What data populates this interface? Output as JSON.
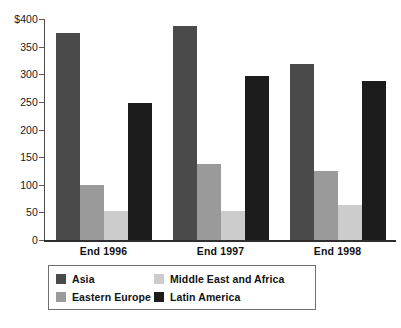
{
  "chart_data": {
    "type": "bar",
    "title": "",
    "subtitle": "",
    "xlabel": "",
    "ylabel": "",
    "categories": [
      "End 1996",
      "End 1997",
      "End 1998"
    ],
    "series": [
      {
        "name": "Asia",
        "color": "#4a4a4a",
        "values": [
          375,
          387,
          318
        ]
      },
      {
        "name": "Eastern Europe",
        "color": "#9a9a9a",
        "values": [
          100,
          138,
          124
        ]
      },
      {
        "name": "Middle East and Africa",
        "color": "#cccccc",
        "values": [
          53,
          53,
          64
        ]
      },
      {
        "name": "Latin America",
        "color": "#1c1c1c",
        "values": [
          248,
          297,
          288
        ]
      }
    ],
    "ylim": [
      0,
      400
    ],
    "y_ticks": [
      0,
      50,
      100,
      150,
      200,
      250,
      300,
      350,
      400
    ],
    "y_tick_labels": [
      "0",
      "50",
      "100",
      "150",
      "200",
      "250",
      "300",
      "350",
      "$400"
    ],
    "grid": false,
    "legend_position": "bottom"
  },
  "axis": {
    "currency_prefix": "$"
  },
  "legend": {
    "entries": [
      {
        "label": "Asia",
        "color": "#4a4a4a"
      },
      {
        "label": "Eastern Europe",
        "color": "#9a9a9a"
      },
      {
        "label": "Middle East and Africa",
        "color": "#cccccc"
      },
      {
        "label": "Latin America",
        "color": "#1c1c1c"
      }
    ]
  }
}
